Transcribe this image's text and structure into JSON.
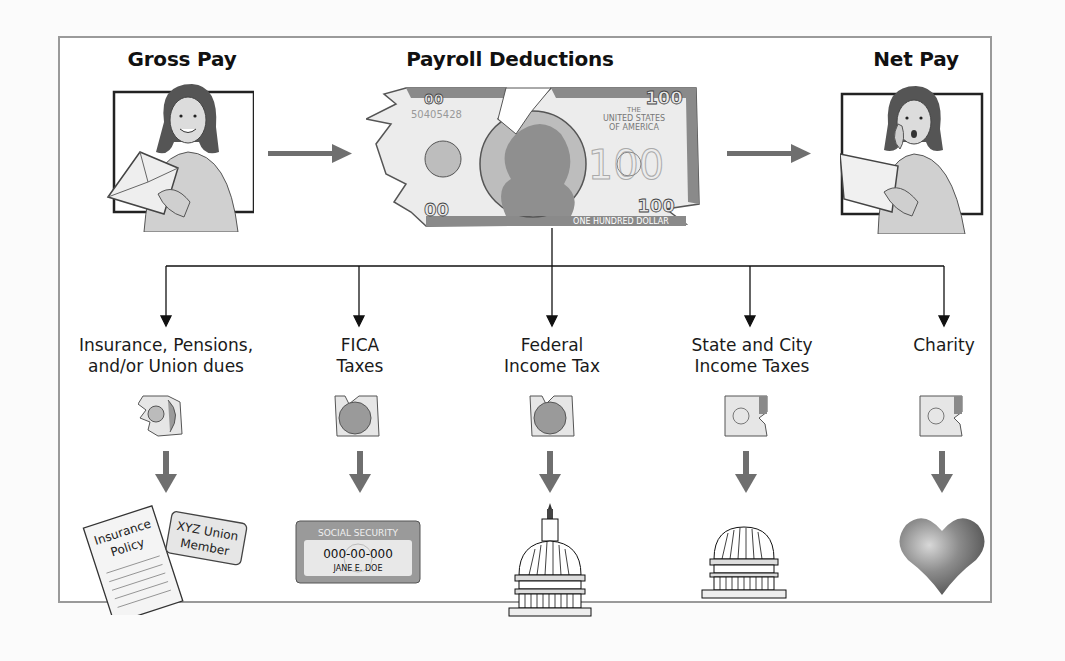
{
  "diagram": {
    "top_row": {
      "gross_pay": {
        "title": "Gross Pay",
        "icon": "woman-with-envelope"
      },
      "payroll_deductions": {
        "title": "Payroll Deductions",
        "bill": {
          "serial": "50405428",
          "top_text": "THE",
          "country_line1": "UNITED STATES",
          "country_line2": "OF AMERICA",
          "denomination": "100",
          "bottom_text": "ONE HUNDRED DOLLAR"
        }
      },
      "net_pay": {
        "title": "Net Pay",
        "icon": "surprised-woman-with-paper"
      }
    },
    "deductions": [
      {
        "label_line1": "Insurance, Pensions,",
        "label_line2": "and/or Union dues",
        "destination_icon": "insurance-policy-and-union-card"
      },
      {
        "label_line1": "FICA",
        "label_line2": "Taxes",
        "destination_icon": "social-security-card"
      },
      {
        "label_line1": "Federal",
        "label_line2": "Income Tax",
        "destination_icon": "capitol-dome"
      },
      {
        "label_line1": "State and City",
        "label_line2": "Income Taxes",
        "destination_icon": "state-capitol-dome"
      },
      {
        "label_line1": "Charity",
        "label_line2": "",
        "destination_icon": "heart"
      }
    ],
    "insurance_doc": {
      "line1": "Insurance",
      "line2": "Policy"
    },
    "union_card": {
      "line1": "XYZ Union",
      "line2": "Member"
    },
    "ss_card": {
      "header": "SOCIAL SECURITY",
      "number": "000-00-000",
      "name": "JANE E. DOE"
    },
    "colors": {
      "frame": "#9a9a9a",
      "arrow_gray": "#6f6f6f",
      "connector": "#111111",
      "bill_dark": "#8a8a8a",
      "bill_light": "#e6e6e6",
      "heart": "#8c8c8c"
    }
  }
}
